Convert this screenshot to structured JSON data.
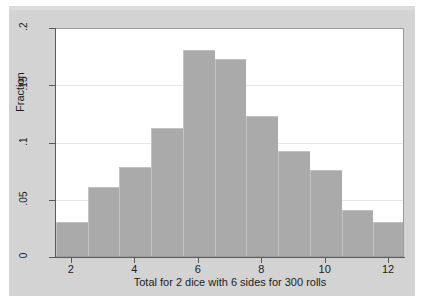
{
  "chart_data": {
    "type": "bar",
    "title": "",
    "xlabel": "Total for 2 dice with 6 sides for 300 rolls",
    "ylabel": "Fraction",
    "categories": [
      "2",
      "3",
      "4",
      "5",
      "6",
      "7",
      "8",
      "9",
      "10",
      "11",
      "12"
    ],
    "values": [
      0.03,
      0.06,
      0.078,
      0.112,
      0.18,
      0.172,
      0.122,
      0.092,
      0.075,
      0.04,
      0.03
    ],
    "xlim": [
      1.5,
      12.5
    ],
    "ylim": [
      0,
      0.2
    ],
    "x_ticks": [
      "2",
      "4",
      "6",
      "8",
      "10",
      "12"
    ],
    "x_tick_values": [
      2,
      4,
      6,
      8,
      10,
      12
    ],
    "y_ticks": [
      "0",
      ".05",
      ".1",
      ".15",
      ".2"
    ],
    "y_tick_values": [
      0,
      0.05,
      0.1,
      0.15,
      0.2
    ],
    "grid": true,
    "grid_axis": "y",
    "legend": null,
    "bar_color": "#aaaaaa",
    "plot_background": "#ffffff",
    "figure_background": "#d3d3d3",
    "gridline_color": "#e6e6e6",
    "axis_color": "#5a5a5a"
  }
}
